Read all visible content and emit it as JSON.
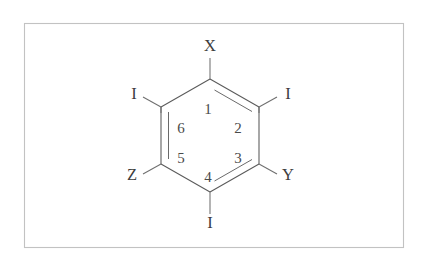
{
  "figure": {
    "name": "hexagonal-ring-structure",
    "background_color": "#ffffff",
    "frame": {
      "stroke_color": "#c2c2c2",
      "x": 24,
      "y": 23,
      "width": 380,
      "height": 225
    },
    "bond_color": "#595959",
    "label_color": "#3d3d3d"
  },
  "ring": {
    "shape": "hexagon",
    "center_x": 210,
    "center_y": 135.5,
    "vertices": [
      {
        "id": "v-top",
        "x": 210,
        "y": 79
      },
      {
        "id": "v-upper-right",
        "x": 259,
        "y": 107
      },
      {
        "id": "v-lower-right",
        "x": 259,
        "y": 164
      },
      {
        "id": "v-bottom",
        "x": 210,
        "y": 192
      },
      {
        "id": "v-lower-left",
        "x": 161,
        "y": 164
      },
      {
        "id": "v-upper-left",
        "x": 161,
        "y": 107
      }
    ],
    "double_bond_edges": [
      "left-vertical",
      "upper-right",
      "lower-right"
    ]
  },
  "positions": [
    {
      "number": "1",
      "x": 208,
      "y": 114
    },
    {
      "number": "2",
      "x": 238,
      "y": 133
    },
    {
      "number": "3",
      "x": 238,
      "y": 163
    },
    {
      "number": "4",
      "x": 208,
      "y": 182
    },
    {
      "number": "5",
      "x": 181,
      "y": 163
    },
    {
      "number": "6",
      "x": 181,
      "y": 133
    }
  ],
  "substituents": [
    {
      "id": "substituent-top",
      "label": "X",
      "x": 210,
      "y": 51,
      "attached_to": "v-top"
    },
    {
      "id": "substituent-upper-left",
      "label": "I",
      "x": 134,
      "y": 99,
      "attached_to": "v-upper-left"
    },
    {
      "id": "substituent-upper-right",
      "label": "I",
      "x": 288,
      "y": 99,
      "attached_to": "v-upper-right"
    },
    {
      "id": "substituent-lower-right",
      "label": "Y",
      "x": 288,
      "y": 180,
      "attached_to": "v-lower-right"
    },
    {
      "id": "substituent-bottom",
      "label": "I",
      "x": 210,
      "y": 228,
      "attached_to": "v-bottom"
    },
    {
      "id": "substituent-lower-left",
      "label": "Z",
      "x": 132,
      "y": 180,
      "attached_to": "v-lower-left"
    }
  ]
}
